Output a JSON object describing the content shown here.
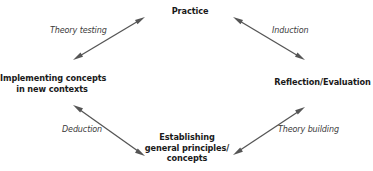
{
  "diagram": {
    "nodes": {
      "practice": {
        "lines": [
          "Practice"
        ]
      },
      "reflection": {
        "lines": [
          "Reflection/Evaluation"
        ]
      },
      "principles": {
        "lines": [
          "Establishing",
          "general principles/",
          "concepts"
        ]
      },
      "implementing": {
        "lines": [
          "Implementing concepts",
          "in new contexts"
        ]
      }
    },
    "edges": [
      {
        "id": "theory-testing",
        "label": "Theory testing",
        "from": "implementing",
        "to": "practice",
        "bidirectional": true
      },
      {
        "id": "induction",
        "label": "Induction",
        "from": "practice",
        "to": "reflection",
        "bidirectional": true
      },
      {
        "id": "theory-building",
        "label": "Theory building",
        "from": "reflection",
        "to": "principles",
        "bidirectional": true
      },
      {
        "id": "deduction",
        "label": "Deduction",
        "from": "principles",
        "to": "implementing",
        "bidirectional": true
      }
    ],
    "colors": {
      "arrow": "#555555",
      "text": "#1a1a1a",
      "label": "#3a3a3a"
    }
  }
}
